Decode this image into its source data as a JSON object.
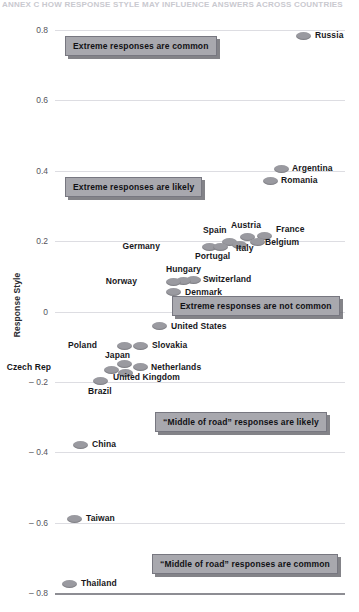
{
  "cut_title": "ANNEX C  HOW RESPONSE STYLE MAY INFLUENCE ANSWERS ACROSS COUNTRIES",
  "axis": {
    "ylabel": "Response Style",
    "yticks": [
      {
        "value": 0.8,
        "label": "0.8"
      },
      {
        "value": 0.6,
        "label": "0.6"
      },
      {
        "value": 0.4,
        "label": "0.4"
      },
      {
        "value": 0.2,
        "label": "0.2"
      },
      {
        "value": 0.0,
        "label": "0"
      },
      {
        "value": -0.2,
        "label": "– 0.2"
      },
      {
        "value": -0.4,
        "label": "– 0.4"
      },
      {
        "value": -0.6,
        "label": "– 0.6"
      },
      {
        "value": -0.8,
        "label": "– 0.8"
      }
    ]
  },
  "callouts": [
    {
      "text": "Extreme responses are common",
      "x": 65,
      "y": 36
    },
    {
      "text": "Extreme responses are likely",
      "x": 65,
      "y": 177
    },
    {
      "text": "Extreme responses are not common",
      "x": 172,
      "y": 296
    },
    {
      "text": "“Middle of road” responses are likely",
      "x": 155,
      "y": 412
    },
    {
      "text": "“Middle of road” responses are common",
      "x": 152,
      "y": 554
    }
  ],
  "chart_data": {
    "type": "scatter",
    "title": "",
    "xlabel": "",
    "ylabel": "Response Style",
    "ylim": [
      -0.8,
      0.8
    ],
    "grid": true,
    "legend": "none",
    "points": [
      {
        "name": "Russia",
        "value": 0.78,
        "mx": 296,
        "my": 32,
        "lx": 315,
        "ly": 31,
        "side": "right"
      },
      {
        "name": "Argentina",
        "value": 0.37,
        "mx": 274,
        "my": 165,
        "lx": 292,
        "ly": 164,
        "side": "right"
      },
      {
        "name": "Romania",
        "value": 0.345,
        "mx": 263,
        "my": 177,
        "lx": 281,
        "ly": 176,
        "side": "right"
      },
      {
        "name": "France",
        "value": 0.215,
        "mx": 257,
        "my": 232,
        "lx": 276,
        "ly": 225,
        "side": "right"
      },
      {
        "name": "Austria",
        "value": 0.215,
        "mx": 240,
        "my": 233,
        "lx": 231,
        "ly": 221,
        "side": "right"
      },
      {
        "name": "Belgium",
        "value": 0.2,
        "mx": 250,
        "my": 238,
        "lx": 265,
        "ly": 238,
        "side": "right"
      },
      {
        "name": "Spain",
        "value": 0.195,
        "mx": 222,
        "my": 238,
        "lx": 203,
        "ly": 226,
        "side": "right"
      },
      {
        "name": "Italy",
        "value": 0.185,
        "mx": 232,
        "my": 241,
        "lx": 236,
        "ly": 244,
        "side": "right"
      },
      {
        "name": "Germany",
        "value": 0.178,
        "mx": 202,
        "my": 243,
        "lx": 160,
        "ly": 242,
        "side": "left"
      },
      {
        "name": "Portugal",
        "value": 0.175,
        "mx": 213,
        "my": 243,
        "lx": 195,
        "ly": 252,
        "side": "right"
      },
      {
        "name": "Switzerland",
        "value": 0.118,
        "mx": 186,
        "my": 276,
        "lx": 203,
        "ly": 275,
        "side": "right"
      },
      {
        "name": "Hungary",
        "value": 0.115,
        "mx": 176,
        "my": 277,
        "lx": 166,
        "ly": 265,
        "side": "right"
      },
      {
        "name": "Norway",
        "value": 0.112,
        "mx": 166,
        "my": 278,
        "lx": 137,
        "ly": 277,
        "side": "left"
      },
      {
        "name": "Denmark",
        "value": 0.092,
        "mx": 166,
        "my": 288,
        "lx": 185,
        "ly": 288,
        "side": "right"
      },
      {
        "name": "United States",
        "value": -0.045,
        "mx": 152,
        "my": 322,
        "lx": 171,
        "ly": 322,
        "side": "right"
      },
      {
        "name": "Poland",
        "value": -0.125,
        "mx": 117,
        "my": 342,
        "lx": 97,
        "ly": 341,
        "side": "left"
      },
      {
        "name": "Slovakia",
        "value": -0.125,
        "mx": 133,
        "my": 342,
        "lx": 152,
        "ly": 341,
        "side": "right"
      },
      {
        "name": "Japan",
        "value": -0.165,
        "mx": 117,
        "my": 360,
        "lx": 105,
        "ly": 351,
        "side": "right"
      },
      {
        "name": "Netherlands",
        "value": -0.172,
        "mx": 133,
        "my": 363,
        "lx": 151,
        "ly": 363,
        "side": "right"
      },
      {
        "name": "Czech Rep",
        "value": -0.185,
        "mx": 104,
        "my": 366,
        "lx": 51,
        "ly": 363,
        "side": "left"
      },
      {
        "name": "United Kingdom",
        "value": -0.188,
        "mx": 118,
        "my": 369,
        "lx": 113,
        "ly": 373,
        "side": "right"
      },
      {
        "name": "Brazil",
        "value": -0.215,
        "mx": 93,
        "my": 377,
        "lx": 88,
        "ly": 387,
        "side": "right"
      },
      {
        "name": "China",
        "value": -0.395,
        "mx": 73,
        "my": 441,
        "lx": 92,
        "ly": 440,
        "side": "right"
      },
      {
        "name": "Taiwan",
        "value": -0.63,
        "mx": 67,
        "my": 515,
        "lx": 86,
        "ly": 514,
        "side": "right"
      },
      {
        "name": "Thailand",
        "value": -0.775,
        "mx": 62,
        "my": 580,
        "lx": 81,
        "ly": 579,
        "side": "right"
      }
    ]
  }
}
